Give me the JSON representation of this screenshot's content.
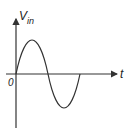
{
  "diagram": {
    "type": "sine-wave-plot",
    "y_axis_label": "V",
    "y_axis_subscript": "in",
    "x_axis_label": "t",
    "origin_label": "0",
    "waveform": "one full sine cycle starting at origin, positive half first",
    "colors": {
      "stroke": "#333333",
      "background": "#ffffff"
    }
  }
}
